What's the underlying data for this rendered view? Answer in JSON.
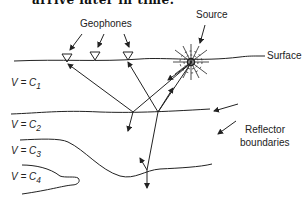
{
  "caption": "arrive later in time.",
  "labels": {
    "geophones": "Geophones",
    "source": "Source",
    "surface": "Surface",
    "reflector_line1": "Reflector",
    "reflector_line2": "boundaries"
  },
  "layers": [
    {
      "label": "V = C",
      "sub": "1"
    },
    {
      "label": "V = C",
      "sub": "2"
    },
    {
      "label": "V = C",
      "sub": "3"
    },
    {
      "label": "V = C",
      "sub": "4"
    }
  ],
  "geophone_count": 3
}
